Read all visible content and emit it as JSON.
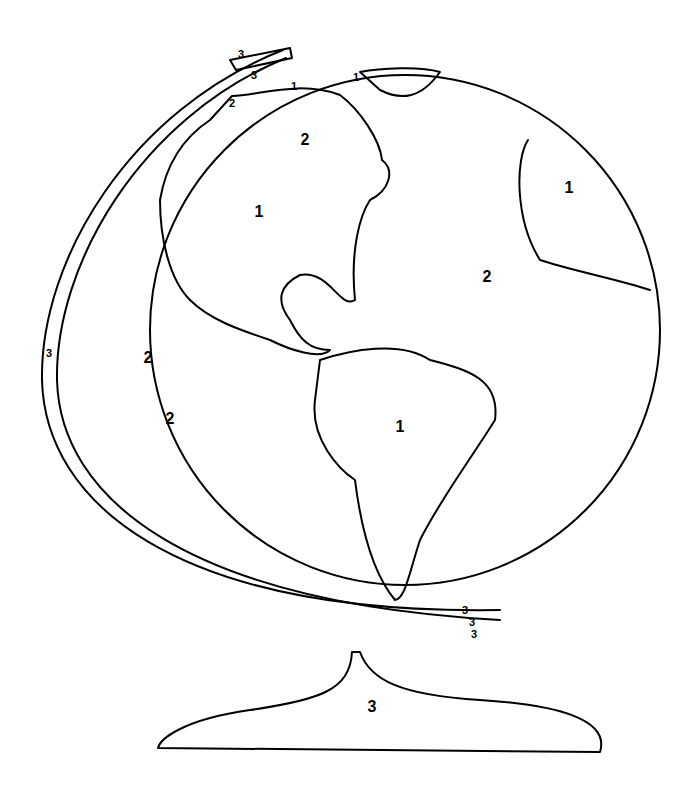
{
  "illustration": {
    "subject": "Color-by-number globe on stand",
    "background": "#ffffff",
    "line_color": "#000000"
  },
  "labels": [
    {
      "id": "greenland",
      "text": "1",
      "x": 356,
      "y": 77,
      "size": "sm"
    },
    {
      "id": "arctic-canada",
      "text": "1",
      "x": 294,
      "y": 86,
      "size": "sm"
    },
    {
      "id": "alaska-water",
      "text": "2",
      "x": 232,
      "y": 103,
      "size": "sm"
    },
    {
      "id": "hudson-bay",
      "text": "2",
      "x": 305,
      "y": 140,
      "size": "big"
    },
    {
      "id": "north-america",
      "text": "1",
      "x": 259,
      "y": 212,
      "size": "big"
    },
    {
      "id": "europe-africa",
      "text": "1",
      "x": 569,
      "y": 188,
      "size": "big"
    },
    {
      "id": "atlantic",
      "text": "2",
      "x": 487,
      "y": 277,
      "size": "big"
    },
    {
      "id": "pacific-1",
      "text": "2",
      "x": 148,
      "y": 358,
      "size": "big"
    },
    {
      "id": "pacific-2",
      "text": "2",
      "x": 170,
      "y": 419,
      "size": "big"
    },
    {
      "id": "south-america",
      "text": "1",
      "x": 400,
      "y": 427,
      "size": "big"
    },
    {
      "id": "meridian-top",
      "text": "3",
      "x": 241,
      "y": 54,
      "size": "sm"
    },
    {
      "id": "meridian-clip-top",
      "text": "3",
      "x": 254,
      "y": 75,
      "size": "sm"
    },
    {
      "id": "meridian-side",
      "text": "3",
      "x": 49,
      "y": 353,
      "size": "sm"
    },
    {
      "id": "meridian-clip-bottom",
      "text": "3",
      "x": 465,
      "y": 610,
      "size": "sm"
    },
    {
      "id": "meridian-bottom",
      "text": "3",
      "x": 472,
      "y": 622,
      "size": "sm"
    },
    {
      "id": "meridian-knob",
      "text": "3",
      "x": 474,
      "y": 634,
      "size": "sm"
    },
    {
      "id": "stand-base",
      "text": "3",
      "x": 372,
      "y": 707,
      "size": "big"
    }
  ],
  "legend_hint": {
    "1": "land",
    "2": "water",
    "3": "stand"
  }
}
